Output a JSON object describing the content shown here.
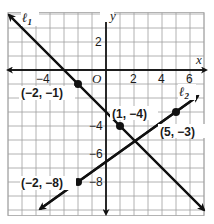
{
  "chart_data": {
    "type": "line",
    "title": "",
    "xlabel": "x",
    "ylabel": "y",
    "xlim": [
      -7,
      7
    ],
    "ylim": [
      -10.4,
      4.1
    ],
    "grid": true,
    "grid_step": 1,
    "origin_label": "O",
    "x_ticks": [
      {
        "value": -4,
        "label": "−4"
      },
      {
        "value": 2,
        "label": "2"
      },
      {
        "value": 4,
        "label": "4"
      },
      {
        "value": 6,
        "label": "6"
      }
    ],
    "y_ticks": [
      {
        "value": 2,
        "label": "2"
      },
      {
        "value": -4,
        "label": "−4"
      },
      {
        "value": -6,
        "label": "−6"
      },
      {
        "value": -8,
        "label": "−8"
      }
    ],
    "series": [
      {
        "name": "ℓ1",
        "label": "ℓ1",
        "equation": "y = -x - 3",
        "points": [
          {
            "x": -2,
            "y": -1,
            "label": "(−2, −1)"
          },
          {
            "x": 1,
            "y": -4,
            "label": "(1, −4)"
          }
        ],
        "arrow_ends": [
          {
            "x": -7,
            "y": 4
          },
          {
            "x": 7,
            "y": -10
          }
        ]
      },
      {
        "name": "ℓ2",
        "label": "ℓ2",
        "equation": "y = (5/7)x - 46/7",
        "points": [
          {
            "x": -2,
            "y": -8,
            "label": "(−2, −8)"
          },
          {
            "x": 5,
            "y": -3,
            "label": "(5, −3)"
          }
        ],
        "arrow_ends": [
          {
            "x": -4.7,
            "y": -9.93
          },
          {
            "x": 6.6,
            "y": -1.86
          }
        ]
      }
    ]
  },
  "labels": {
    "l1": "ℓ",
    "l1_sub": "1",
    "l2": "ℓ",
    "l2_sub": "2",
    "x_axis": "x",
    "y_axis": "y",
    "origin": "O",
    "p1": "(−2, −1)",
    "p2": "(1, −4)",
    "p3": "(5, −3)",
    "p4": "(−2, −8)",
    "tick_xm4": "−4",
    "tick_x2": "2",
    "tick_x4": "4",
    "tick_x6": "6",
    "tick_y2": "2",
    "tick_ym4": "−4",
    "tick_ym6": "−6",
    "tick_ym8": "−8"
  },
  "colors": {
    "grid": "#9a9a9a",
    "axis": "#1a1a1a",
    "line": "#111111"
  }
}
